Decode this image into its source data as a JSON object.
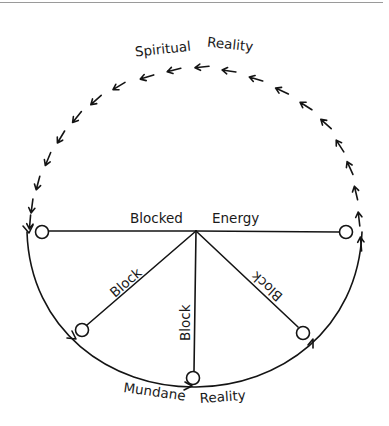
{
  "diagram": {
    "type": "energy-flow-cycle",
    "colors": {
      "ink": "#141414",
      "background": "#ffffff",
      "frame_line": "#9a9a9a"
    },
    "labels": {
      "top_left": "Spiritual",
      "top_right": "Reality",
      "center_left": "Blocked",
      "center_right": "Energy",
      "block_left": "Block",
      "block_center": "Block",
      "block_right": "Block",
      "bottom_left": "Mundane",
      "bottom_right": "Reality"
    },
    "upper_arc": {
      "style": "chain of arrows",
      "direction": "counter-clockwise (up right side, across top, down left side)",
      "arrow_count": 22
    },
    "lower_arc": {
      "style": "solid curve",
      "direction": "left to right along bottom"
    },
    "hub": {
      "x": 196,
      "y": 231
    },
    "nodes": [
      {
        "id": "left",
        "x": 42,
        "y": 232
      },
      {
        "id": "right",
        "x": 346,
        "y": 232
      },
      {
        "id": "lower-left",
        "x": 82,
        "y": 330
      },
      {
        "id": "bottom",
        "x": 193,
        "y": 378
      },
      {
        "id": "lower-right",
        "x": 303,
        "y": 333
      }
    ]
  }
}
